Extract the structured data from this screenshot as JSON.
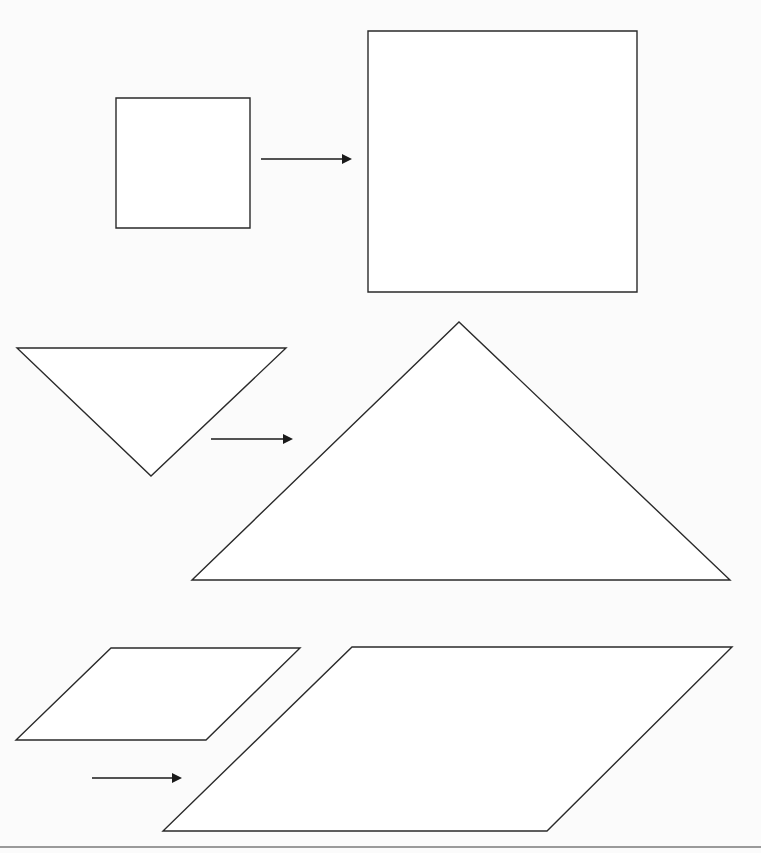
{
  "diagram": {
    "title": "",
    "colors": {
      "background": "#fbfbfb",
      "shape_fill": "#ffffff",
      "stroke": "#2a2a2a",
      "arrow": "#1a1a1a"
    },
    "rows": [
      {
        "name": "square",
        "original": {
          "type": "rectangle",
          "points": "116,98 250,98 250,228 116,228"
        },
        "arrow": {
          "x1": 261,
          "y1": 159,
          "x2": 352,
          "y2": 159
        },
        "enlarged": {
          "type": "rectangle",
          "points": "368,31 637,31 637,292 368,292"
        }
      },
      {
        "name": "triangle",
        "original": {
          "type": "triangle",
          "points": "17,348 286,348 151,476"
        },
        "arrow": {
          "x1": 211,
          "y1": 439,
          "x2": 293,
          "y2": 439
        },
        "enlarged": {
          "type": "triangle",
          "points": "192,580 459,322 730,580"
        }
      },
      {
        "name": "parallelogram",
        "original": {
          "type": "parallelogram",
          "points": "111,648 300,648 206,740 16,740"
        },
        "arrow": {
          "x1": 92,
          "y1": 778,
          "x2": 182,
          "y2": 778
        },
        "enlarged": {
          "type": "parallelogram",
          "points": "352,647 732,647 547,831 163,831"
        }
      }
    ],
    "bottom_rule": {
      "x1": 0,
      "y1": 847,
      "x2": 761,
      "y2": 847
    }
  }
}
